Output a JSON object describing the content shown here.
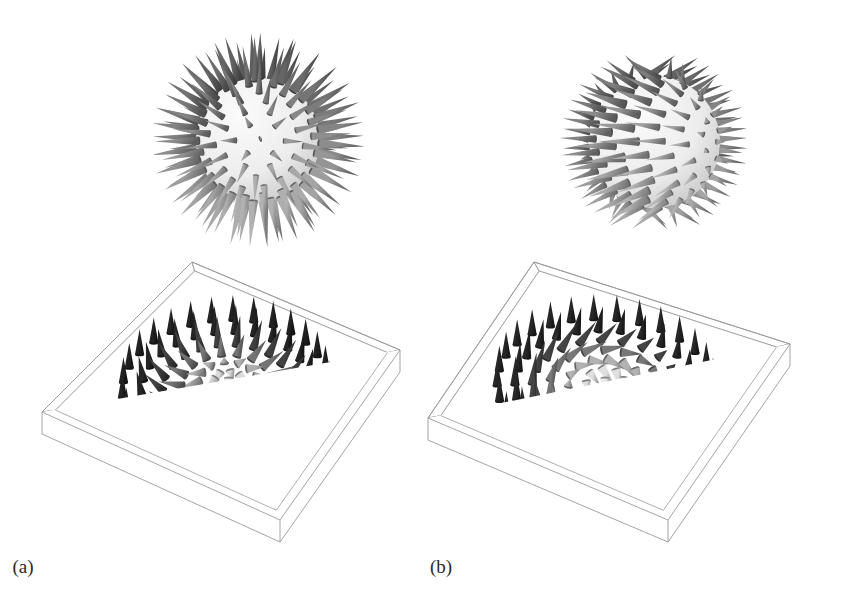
{
  "figure": {
    "background_color": "#ffffff",
    "width": 844,
    "height": 613,
    "panels": [
      {
        "id": "a",
        "caption": "(a)",
        "type": "neel-hedgehog-skyrmion",
        "sphere_label": "hedgehog sphere with radial outward cones",
        "box_label": "square 3D box containing a radial (Neel) skyrmion cone lattice",
        "field_kind": "radial",
        "sphere": {
          "center_x": 258,
          "center_y": 130,
          "radius": 62,
          "spike_count": 118,
          "spike_length": 46,
          "core_color": "#e8e8e8"
        },
        "box": {
          "corner_top": {
            "x": 192,
            "y": 14
          },
          "corner_left": {
            "x": 42,
            "y": 164
          },
          "corner_right": {
            "x": 400,
            "y": 102
          },
          "corner_bottom": {
            "x": 280,
            "y": 272
          },
          "wall_height": 22,
          "edge_color": "#9a9a9a",
          "wall_fill": "#fefefe"
        },
        "lattice": {
          "rings": [
            0,
            1,
            2,
            3,
            4,
            5,
            6
          ],
          "ring_counts": [
            1,
            8,
            14,
            18,
            22,
            26,
            30
          ],
          "cone_count": 119,
          "ring_tilt_degrees": [
            0,
            26,
            52,
            78,
            104,
            140,
            176
          ]
        }
      },
      {
        "id": "b",
        "caption": "(b)",
        "type": "bloch-vortex-skyrmion",
        "sphere_label": "sphere with tangentially swirled cones forming latitude bands",
        "box_label": "square 3D box containing a circular (Bloch) skyrmion cone lattice",
        "field_kind": "tangential",
        "sphere": {
          "center_x": 232,
          "center_y": 132,
          "radius": 66,
          "spike_count": 112,
          "spike_length": 42,
          "core_color": "#e6e6e6"
        },
        "box": {
          "corner_top": {
            "x": 112,
            "y": 14
          },
          "corner_left": {
            "x": 6,
            "y": 170
          },
          "corner_right": {
            "x": 368,
            "y": 96
          },
          "corner_bottom": {
            "x": 246,
            "y": 272
          },
          "wall_height": 22,
          "edge_color": "#9a9a9a",
          "wall_fill": "#fefefe"
        },
        "lattice": {
          "rings": [
            0,
            1,
            2,
            3,
            4,
            5,
            6
          ],
          "ring_counts": [
            1,
            8,
            14,
            18,
            22,
            26,
            30
          ],
          "cone_count": 119,
          "ring_tilt_degrees": [
            0,
            26,
            52,
            78,
            104,
            140,
            176
          ]
        }
      }
    ],
    "shading": {
      "description": "Grayscale cone shading: cones pointing up (out of plane) are dark, cones lying in-plane or pointing down are light.",
      "dark": "#1d1d1d",
      "mid": "#7a7a7a",
      "light": "#d9d9d9",
      "outline": "#555555"
    }
  },
  "chart_data": {
    "type": "scatter",
    "xlabel": "",
    "ylabel": "",
    "panels": [
      "(a)",
      "(b)"
    ],
    "series": [
      {
        "name": "(a) Neel (hedgehog) skyrmion",
        "field": "radial",
        "ring_radii": [
          0,
          1,
          2,
          3,
          4,
          5,
          6
        ],
        "ring_counts": [
          1,
          8,
          14,
          18,
          22,
          26,
          30
        ],
        "polar_angle_deg": [
          180,
          150,
          120,
          90,
          60,
          25,
          2
        ],
        "mz": [
          -1.0,
          -0.87,
          -0.5,
          0.0,
          0.5,
          0.91,
          1.0
        ]
      },
      {
        "name": "(b) Bloch (vortex) skyrmion",
        "field": "tangential",
        "ring_radii": [
          0,
          1,
          2,
          3,
          4,
          5,
          6
        ],
        "ring_counts": [
          1,
          8,
          14,
          18,
          22,
          26,
          30
        ],
        "polar_angle_deg": [
          180,
          150,
          120,
          90,
          60,
          25,
          2
        ],
        "mz": [
          -1.0,
          -0.87,
          -0.5,
          0.0,
          0.5,
          0.91,
          1.0
        ]
      }
    ],
    "legend": "none",
    "grid": false
  }
}
